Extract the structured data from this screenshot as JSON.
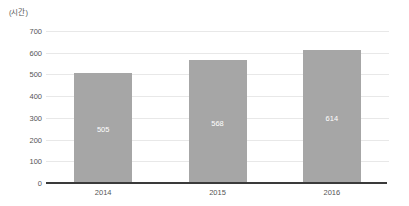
{
  "chart_data": {
    "type": "bar",
    "title": "",
    "subtitle": "",
    "unit_label": "(시간)",
    "categories": [
      "2014",
      "2015",
      "2016"
    ],
    "values": [
      505,
      568,
      614
    ],
    "data_labels": [
      "505",
      "568",
      "614"
    ],
    "series": [
      {
        "name": "",
        "values": [
          505,
          568,
          614
        ]
      }
    ],
    "xlabel": "",
    "ylabel": "",
    "ylim": [
      0,
      700
    ],
    "yticks": [
      0,
      100,
      200,
      300,
      400,
      500,
      600,
      700
    ],
    "ytick_labels": [
      "0",
      "100",
      "200",
      "300",
      "400",
      "500",
      "600",
      "700"
    ],
    "grid": true,
    "grid_axis": "y",
    "legend": false,
    "legend_position": "none",
    "colors": {
      "bar": "#a6a6a6",
      "grid": "#e8e8e8",
      "axis": "#3a3a3a",
      "tick_text": "#555555",
      "data_label_text": "#ffffff",
      "background": "#ffffff"
    }
  }
}
